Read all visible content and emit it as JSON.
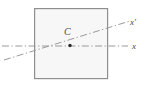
{
  "figure": {
    "type": "diagram",
    "title": "",
    "background_color": "#ffffff",
    "width": 148,
    "height": 87,
    "shapes": {
      "square": {
        "name": "cross-section-square",
        "x": 34,
        "y": 8,
        "width": 74,
        "height": 71,
        "fill_color": "#f7f7f7",
        "stroke_color": "#8f8f8f",
        "stroke_width": 1.2
      },
      "centroid_point": {
        "name": "centroid-marker",
        "cx": 70,
        "cy": 45.5,
        "radius": 1.6,
        "color": "#2b2b2b"
      }
    },
    "lines": {
      "x_axis": {
        "name": "x-axis-line",
        "style": "dash-dot",
        "x1": 2,
        "y1": 46,
        "x2": 128,
        "y2": 46,
        "color": "#8f8f8f",
        "stroke_width": 1
      },
      "x_prime_axis": {
        "name": "x-prime-axis-line",
        "style": "dash-dot",
        "x1": 4,
        "y1": 60,
        "x2": 130,
        "y2": 21,
        "color": "#8f8f8f",
        "stroke_width": 1
      }
    },
    "labels": {
      "x_prime": "x′",
      "x": "x",
      "centroid": "C"
    },
    "colors": {
      "square_fill": "#f7f7f7",
      "square_stroke": "#8f8f8f",
      "line": "#8f8f8f",
      "text": "#4a4a4a",
      "point": "#2b2b2b"
    }
  }
}
